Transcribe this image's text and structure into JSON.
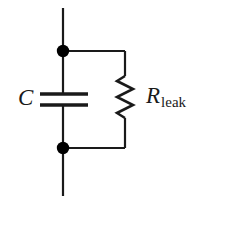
{
  "diagram": {
    "background_color": "#ffffff",
    "line_color": "#1a1a1a",
    "node_color": "#000000"
  },
  "components": {
    "capacitor": {
      "symbol": "C",
      "name": "capacitor",
      "icon": "capacitor-icon"
    },
    "resistor": {
      "symbol": "R",
      "subscript": "leak",
      "name": "leakage-resistor",
      "icon": "resistor-zigzag-icon"
    }
  },
  "nodes": {
    "top": {
      "name": "top-junction-node",
      "label": ""
    },
    "bottom": {
      "name": "bottom-junction-node",
      "label": ""
    }
  },
  "terminals": {
    "top_lead": {
      "name": "top-terminal-lead"
    },
    "bottom_lead": {
      "name": "bottom-terminal-lead"
    }
  }
}
